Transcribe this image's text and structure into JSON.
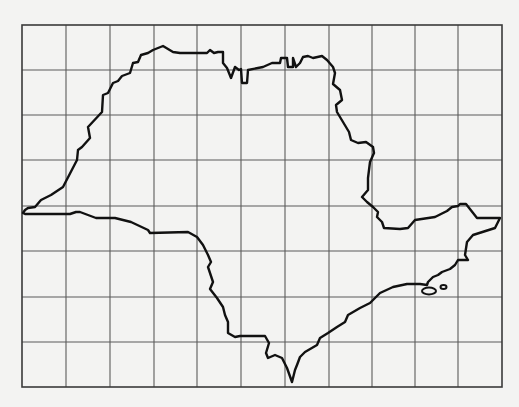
{
  "map": {
    "region_shape": "state-outline",
    "background_color": "#f3f3f2",
    "grid_color": "#5a5a5a",
    "outline_color": "#111111",
    "frame": {
      "x": 22,
      "y": 25,
      "width": 480,
      "height": 362
    },
    "grid": {
      "columns": 11,
      "rows": 8,
      "vertical_lines_x": [
        66,
        110,
        154,
        197,
        241,
        285,
        329,
        372,
        415,
        458
      ],
      "horizontal_lines_y": [
        70,
        115,
        160,
        206,
        251,
        297,
        342
      ]
    },
    "outline_points": "23,213 25,210 28,208 35,207 41,200 51,195 63,187 77,160 78,150 82,147 90,138 88,127 102,112 103,95 108,93 113,83 118,81 122,76 130,73 133,63 138,62 141,55 148,53 153,50 163,46 173,52 180,53 207,53 210,50 214,53 218,52 223,52 223,63 227,68 231,78 235,67 239,70 241,69 242,83 247,83 248,70 263,67 272,63 280,63 281,58 287,58 288,67 293,67 293,58 296,67 300,63 303,57 308,56 313,58 322,56 327,60 333,67 335,73 333,84 340,90 342,100 336,105 337,112 343,122 349,132 351,140 358,143 366,142 373,147 374,153 370,162 368,178 368,190 362,197 367,202 373,207 378,212 377,217 382,222 384,228 400,229 408,228 415,220 435,217 447,211 452,207 458,206 460,204 466,204 477,218 500,218 495,228 473,235 467,242 465,255 468,260 458,260 455,265 450,269 442,272 438,275 433,277 428,282 427,285 420,284 407,284 393,287 380,293 370,303 360,308 348,315 345,322 337,327 328,333 320,338 317,345 305,352 300,357 297,365 295,370 292,382 287,368 282,358 275,355 268,358 266,353 269,343 265,336 240,336 235,337 228,333 228,322 225,315 223,307 217,298 210,289 213,282 208,267 211,262 208,255 203,245 197,237 188,232 150,233 148,230 131,222 115,218 96,218 80,212 76,212 70,214 25,214 23,213",
    "islands": [
      {
        "cx": 429,
        "cy": 291,
        "rx": 7,
        "ry": 3.5
      },
      {
        "cx": 443.5,
        "cy": 287,
        "rx": 3,
        "ry": 2
      }
    ]
  }
}
